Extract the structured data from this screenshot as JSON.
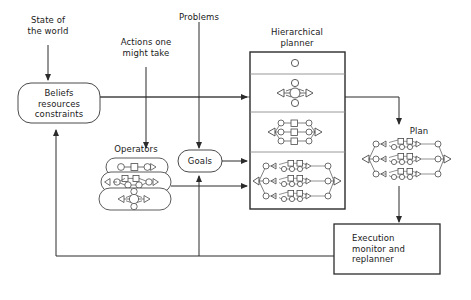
{
  "diagram": {
    "title_elements": {
      "state_of_world": "State of\nthe world",
      "actions": "Actions one\nmight take",
      "problems": "Problems",
      "hierarchical_planner": "Hierarchical\nplanner",
      "operators": "Operators",
      "plan": "Plan"
    },
    "nodes": {
      "beliefs": "Beliefs\nresources\nconstraints",
      "goals": "Goals",
      "execution_monitor": "Execution\nmonitor and\nreplanner"
    },
    "colors": {
      "stroke": "#3a3a3a",
      "text": "#1a1a1a",
      "background": "#ffffff",
      "light_stroke": "#9a9a9a"
    },
    "planner_levels": [
      {
        "level": 1,
        "description": "single-circle-abstract-task"
      },
      {
        "level": 2,
        "description": "diamond-cluster-four-nodes"
      },
      {
        "level": 3,
        "description": "three-parallel-chains"
      },
      {
        "level": 4,
        "description": "three-nested-subnetworks"
      }
    ],
    "operator_cards": [
      {
        "index": 1,
        "description": "circle-square-circle-chain"
      },
      {
        "index": 2,
        "description": "two-row-chain-with-triangles"
      },
      {
        "index": 3,
        "description": "diamond-cluster"
      }
    ],
    "edges": [
      {
        "from": "state_of_world",
        "to": "beliefs"
      },
      {
        "from": "beliefs",
        "to": "hierarchical_planner"
      },
      {
        "from": "actions",
        "to": "operators"
      },
      {
        "from": "problems",
        "to": "goals"
      },
      {
        "from": "goals",
        "to": "hierarchical_planner"
      },
      {
        "from": "operators",
        "to": "hierarchical_planner"
      },
      {
        "from": "hierarchical_planner",
        "to": "plan"
      },
      {
        "from": "plan",
        "to": "execution_monitor"
      },
      {
        "from": "execution_monitor",
        "to": "beliefs"
      },
      {
        "from": "execution_monitor",
        "to": "goals"
      }
    ]
  }
}
